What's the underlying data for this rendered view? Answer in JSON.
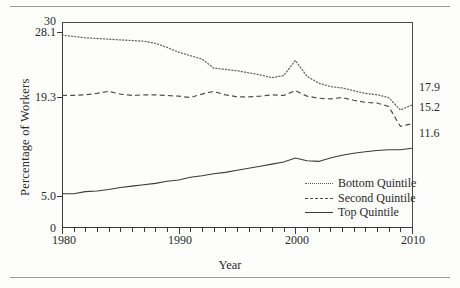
{
  "figure": {
    "y_axis_label": "Percentage of Workers",
    "x_axis_label": "Year"
  },
  "legend": {
    "items": [
      {
        "label": "Bottom Quintile",
        "style": "dotted",
        "key_icon": "dotted-line-icon"
      },
      {
        "label": "Second Quintile",
        "style": "dashed",
        "key_icon": "dashed-line-icon"
      },
      {
        "label": "Top Quintile",
        "style": "solid",
        "key_icon": "solid-line-icon"
      }
    ]
  },
  "axes": {
    "y_ticks_left": [
      "30",
      "28.1",
      "19.3",
      "5.0",
      "0"
    ],
    "y_ticks_right": [
      "17.9",
      "15.2",
      "11.6"
    ],
    "x_ticks": [
      "1980",
      "1990",
      "2000",
      "2010"
    ]
  },
  "chart_data": {
    "type": "line",
    "title": "",
    "xlabel": "Year",
    "ylabel": "Percentage of Workers",
    "xlim": [
      1980,
      2010
    ],
    "ylim": [
      0,
      30
    ],
    "grid": false,
    "legend_position": "inside-bottom-right",
    "y_tick_values": [
      0,
      5.0,
      19.3,
      28.1,
      30
    ],
    "y_tick_labels_right": [
      17.9,
      15.2,
      11.6
    ],
    "x_tick_values": [
      1980,
      1990,
      2000,
      2010
    ],
    "x": [
      1980,
      1981,
      1982,
      1983,
      1984,
      1985,
      1986,
      1987,
      1988,
      1989,
      1990,
      1991,
      1992,
      1993,
      1994,
      1995,
      1996,
      1997,
      1998,
      1999,
      2000,
      2001,
      2002,
      2003,
      2004,
      2005,
      2006,
      2007,
      2008,
      2009,
      2010
    ],
    "series": [
      {
        "name": "Bottom Quintile",
        "style": "dotted",
        "start_value": 28.1,
        "end_value": 17.9,
        "values": [
          28.1,
          27.9,
          27.7,
          27.6,
          27.5,
          27.4,
          27.3,
          27.2,
          26.9,
          26.3,
          25.6,
          25.1,
          24.6,
          23.3,
          23.1,
          22.9,
          22.6,
          22.3,
          21.9,
          22.2,
          24.4,
          22.1,
          21.1,
          20.6,
          20.4,
          20.0,
          19.6,
          19.4,
          19.0,
          17.2,
          17.9
        ]
      },
      {
        "name": "Second Quintile",
        "style": "dashed",
        "start_value": 19.3,
        "end_value": 15.2,
        "values": [
          19.3,
          19.3,
          19.4,
          19.6,
          19.9,
          19.5,
          19.3,
          19.4,
          19.4,
          19.3,
          19.2,
          19.0,
          19.5,
          19.9,
          19.4,
          19.1,
          19.1,
          19.2,
          19.4,
          19.3,
          20.0,
          19.2,
          18.9,
          18.8,
          19.0,
          18.6,
          18.3,
          18.2,
          17.7,
          14.8,
          15.2
        ]
      },
      {
        "name": "Top Quintile",
        "style": "solid",
        "start_value": 5.0,
        "end_value": 11.6,
        "values": [
          5.0,
          5.0,
          5.3,
          5.4,
          5.6,
          5.9,
          6.1,
          6.3,
          6.5,
          6.8,
          7.0,
          7.4,
          7.6,
          7.9,
          8.1,
          8.4,
          8.7,
          9.0,
          9.3,
          9.6,
          10.2,
          9.8,
          9.7,
          10.2,
          10.6,
          10.9,
          11.1,
          11.3,
          11.4,
          11.4,
          11.6
        ]
      }
    ]
  }
}
